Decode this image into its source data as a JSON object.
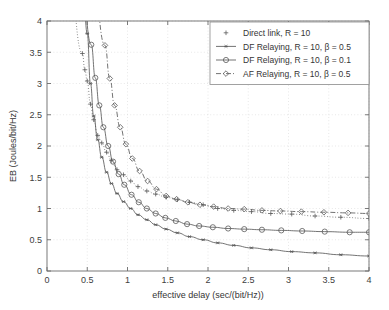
{
  "figure": {
    "background": "#ffffff",
    "axis_color": "#6b6b6b",
    "series_color": "#5a5a5a",
    "grid_color": "#d8d8d8"
  },
  "chart_data": {
    "type": "line",
    "title": "",
    "xlabel": "effective delay (sec/(bit/Hz))",
    "ylabel": "EB (Joules/bit/Hz)",
    "xlim": [
      0,
      4
    ],
    "ylim": [
      0,
      4
    ],
    "xticks": [
      0,
      0.5,
      1,
      1.5,
      2,
      2.5,
      3,
      3.5,
      4
    ],
    "xticklabels": [
      "0",
      "0.5",
      "1",
      "1.5",
      "2",
      "2.5",
      "3",
      "3.5",
      "4"
    ],
    "yticks": [
      0,
      0.5,
      1,
      1.5,
      2,
      2.5,
      3,
      3.5,
      4
    ],
    "yticklabels": [
      "0",
      "0.5",
      "1",
      "1.5",
      "2",
      "2.5",
      "3",
      "3.5",
      "4"
    ],
    "grid": true,
    "legend_position": "upper right",
    "series": [
      {
        "name": "Direct link, R = 10",
        "marker": "plus",
        "linestyle": "dotted",
        "x": [
          0.44,
          0.47,
          0.5,
          0.54,
          0.58,
          0.63,
          0.68,
          0.74,
          0.8,
          0.87,
          0.95,
          1.04,
          1.13,
          1.24,
          1.35,
          1.48,
          1.62,
          1.77,
          1.94,
          2.12,
          2.32,
          2.54,
          2.78,
          3.04,
          3.33,
          3.65,
          4.0
        ],
        "y": [
          3.48,
          3.22,
          3.04,
          2.67,
          2.42,
          2.17,
          2.05,
          1.9,
          1.77,
          1.62,
          1.54,
          1.44,
          1.35,
          1.28,
          1.23,
          1.18,
          1.14,
          1.1,
          1.06,
          1.0,
          0.97,
          0.95,
          0.92,
          0.91,
          0.88,
          0.86,
          0.84
        ]
      },
      {
        "name": "DF Relaying, R = 10, β = 0.5",
        "marker": "asterisk",
        "linestyle": "solid",
        "x": [
          0.5,
          0.54,
          0.58,
          0.63,
          0.68,
          0.74,
          0.8,
          0.87,
          0.95,
          1.04,
          1.13,
          1.24,
          1.35,
          1.48,
          1.62,
          1.77,
          1.94,
          2.12,
          2.32,
          2.54,
          2.78,
          3.04,
          3.33,
          3.65,
          4.0
        ],
        "y": [
          3.8,
          3.0,
          2.48,
          2.1,
          1.82,
          1.58,
          1.4,
          1.24,
          1.11,
          1.0,
          0.9,
          0.82,
          0.74,
          0.67,
          0.61,
          0.55,
          0.5,
          0.45,
          0.41,
          0.37,
          0.34,
          0.31,
          0.29,
          0.26,
          0.24
        ]
      },
      {
        "name": "DF Relaying, R = 10, β = 0.1",
        "marker": "circle",
        "linestyle": "solid",
        "x": [
          0.55,
          0.6,
          0.65,
          0.7,
          0.76,
          0.82,
          0.89,
          0.96,
          1.05,
          1.14,
          1.24,
          1.35,
          1.47,
          1.6,
          1.74,
          1.89,
          2.06,
          2.25,
          2.45,
          2.67,
          2.91,
          3.17,
          3.45,
          3.76,
          4.0
        ],
        "y": [
          3.62,
          3.09,
          2.65,
          2.3,
          2.0,
          1.75,
          1.55,
          1.38,
          1.22,
          1.1,
          1.0,
          0.92,
          0.85,
          0.8,
          0.75,
          0.72,
          0.7,
          0.68,
          0.67,
          0.66,
          0.65,
          0.64,
          0.63,
          0.62,
          0.62
        ]
      },
      {
        "name": "AF Relaying, R = 10, β = 0.5",
        "marker": "diamond",
        "linestyle": "dashdot",
        "x": [
          0.72,
          0.78,
          0.84,
          0.91,
          0.98,
          1.06,
          1.15,
          1.25,
          1.36,
          1.48,
          1.61,
          1.75,
          1.9,
          2.07,
          2.25,
          2.45,
          2.67,
          2.9,
          3.16,
          3.44,
          3.74,
          4.0
        ],
        "y": [
          3.61,
          3.08,
          2.65,
          2.3,
          2.03,
          1.8,
          1.6,
          1.44,
          1.31,
          1.2,
          1.15,
          1.1,
          1.06,
          1.03,
          1.0,
          0.99,
          0.97,
          0.96,
          0.95,
          0.94,
          0.93,
          0.92
        ]
      }
    ]
  },
  "legend": {
    "items": [
      {
        "label": "Direct link, R = 10"
      },
      {
        "label": "DF Relaying, R = 10, β = 0.5"
      },
      {
        "label": "DF Relaying, R = 10, β = 0.1"
      },
      {
        "label": "AF Relaying, R = 10, β = 0.5"
      }
    ]
  }
}
